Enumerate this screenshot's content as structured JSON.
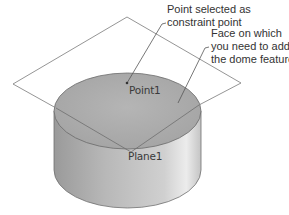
{
  "diagram": {
    "callouts": [
      {
        "id": "point-callout",
        "lines": [
          "Point selected as",
          "constraint point"
        ]
      },
      {
        "id": "face-callout",
        "lines": [
          "Face on which",
          "you need to add",
          "the dome feature"
        ]
      }
    ],
    "labels": {
      "point": "Point1",
      "plane": "Plane1"
    },
    "colors": {
      "line": "#777777",
      "face_top": "#aeaeae",
      "side_dark": "#8f8f8f",
      "side_light": "#e6e6e6",
      "text": "#333333"
    }
  }
}
